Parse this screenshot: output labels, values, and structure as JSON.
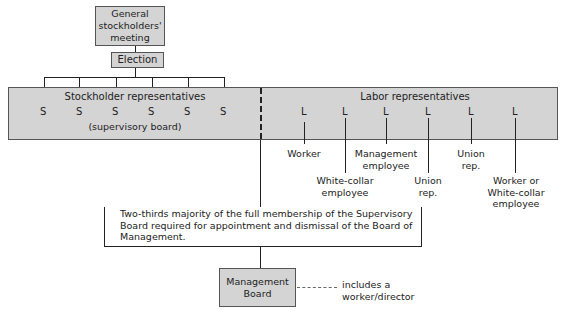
{
  "diagram": {
    "general_meeting": "General stockholders' meeting",
    "general_meeting_lines": [
      "General",
      "stockholders'",
      "meeting"
    ],
    "election": "Election",
    "supervisory": {
      "stockholder_title": "Stockholder representatives",
      "stockholder_letters": [
        "S",
        "S",
        "S",
        "S",
        "S",
        "S"
      ],
      "stockholder_subtitle": "(supervisory board)",
      "labor_title": "Labor representatives",
      "labor_letters": [
        "L",
        "L",
        "L",
        "L",
        "L",
        "L"
      ]
    },
    "labor_roles": [
      {
        "lines": [
          "Worker"
        ]
      },
      {
        "lines": [
          "White-collar",
          "employee"
        ]
      },
      {
        "lines": [
          "Management",
          "employee"
        ]
      },
      {
        "lines": [
          "Union",
          "rep."
        ]
      },
      {
        "lines": [
          "Union",
          "rep."
        ]
      },
      {
        "lines": [
          "Worker or",
          "White-collar",
          "employee"
        ]
      }
    ],
    "rule_text_lines": [
      "Two-thirds majority of the full membership of the Supervisory",
      "Board required for appointment and dismissal of the Board of",
      "Management."
    ],
    "management_board_lines": [
      "Management",
      "Board"
    ],
    "management_note_lines": [
      "includes a",
      "worker/director"
    ]
  }
}
